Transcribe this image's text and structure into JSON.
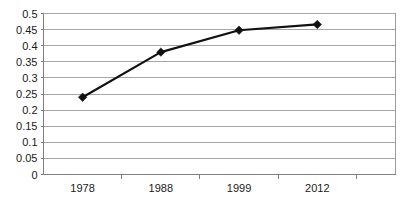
{
  "chart_data": {
    "type": "line",
    "title": "",
    "subtitle": "",
    "xlabel": "",
    "ylabel": "",
    "categories": [
      "1978",
      "1988",
      "1999",
      "2012"
    ],
    "values": [
      0.24,
      0.38,
      0.448,
      0.466
    ],
    "series": [
      {
        "name": "Series 1",
        "values": [
          0.24,
          0.38,
          0.448,
          0.466
        ]
      }
    ],
    "ylim": [
      0,
      0.5
    ],
    "ytick_labels": [
      "0.5",
      "0.45",
      "0.4",
      "0.35",
      "0.3",
      "0.25",
      "0.2",
      "0.15",
      "0.1",
      "0.05",
      "0"
    ],
    "ytick_values": [
      0.5,
      0.45,
      0.4,
      0.35,
      0.3,
      0.25,
      0.2,
      0.15,
      0.1,
      0.05,
      0
    ],
    "ytick_step": 0.05,
    "grid": {
      "horizontal": true,
      "vertical": false,
      "color": "#a6a6a6"
    },
    "legend": {
      "visible": false,
      "position": "none",
      "entries": []
    },
    "marker": {
      "shape": "diamond",
      "color": "#111111"
    },
    "line_color": "#111111",
    "background_color": "#ffffff",
    "annotations": []
  },
  "axes": {
    "y_axis_name": "value-axis",
    "x_axis_name": "category-axis"
  }
}
